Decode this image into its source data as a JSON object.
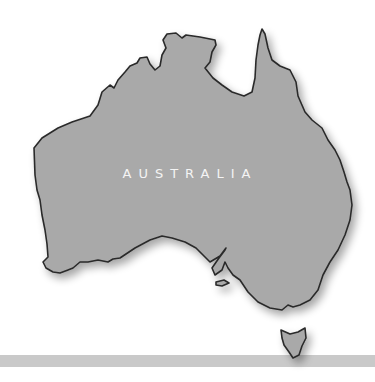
{
  "map": {
    "label": "AUSTRALIA",
    "colors": {
      "land": "#a9a9a9",
      "outline": "#2a2a2a",
      "band": "#c9c9c9",
      "label": "#f4f4f4",
      "background": "#ffffff"
    }
  }
}
